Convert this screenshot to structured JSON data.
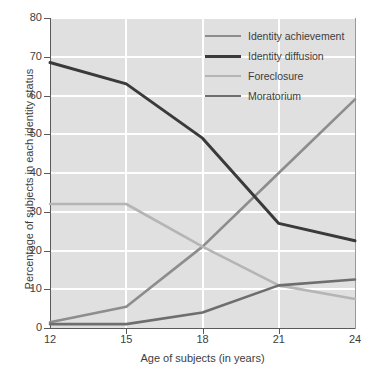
{
  "chart_data": {
    "type": "line",
    "title": "",
    "subtitle": "",
    "xlabel": "Age of subjects (in years)",
    "ylabel": "Percentage of subjects in each identity status",
    "x": [
      12,
      15,
      18,
      21,
      24
    ],
    "xticklabels": [
      "12",
      "15",
      "18",
      "21",
      "24"
    ],
    "yticklabels": [
      "0",
      "10",
      "20",
      "30",
      "40",
      "50",
      "60",
      "70",
      "80"
    ],
    "yticks": [
      0,
      10,
      20,
      30,
      40,
      50,
      60,
      70,
      80
    ],
    "xlim": [
      12,
      24
    ],
    "ylim": [
      0,
      80
    ],
    "grid": true,
    "grid_color": "#ffffff",
    "plot_background": "#e0e0e0",
    "legend_position": "top-right",
    "series": [
      {
        "name": "Identity achievement",
        "color": "#8d8d8d",
        "width": 2.6,
        "values": [
          1.5,
          5.5,
          21,
          40,
          59
        ]
      },
      {
        "name": "Identity diffusion",
        "color": "#3a3a3a",
        "width": 3.0,
        "values": [
          68.5,
          63,
          49,
          27,
          22.5
        ]
      },
      {
        "name": "Foreclosure",
        "color": "#b5b5b5",
        "width": 2.6,
        "values": [
          32,
          32,
          21,
          11,
          7.5
        ]
      },
      {
        "name": "Moratorium",
        "color": "#6e6e6e",
        "width": 2.6,
        "values": [
          1,
          1,
          4,
          11,
          12.5
        ]
      }
    ]
  },
  "legend": {
    "items": [
      {
        "label": "Identity achievement",
        "color": "#8d8d8d"
      },
      {
        "label": "Identity diffusion",
        "color": "#3a3a3a"
      },
      {
        "label": "Foreclosure",
        "color": "#b5b5b5"
      },
      {
        "label": "Moratorium",
        "color": "#6e6e6e"
      }
    ]
  }
}
